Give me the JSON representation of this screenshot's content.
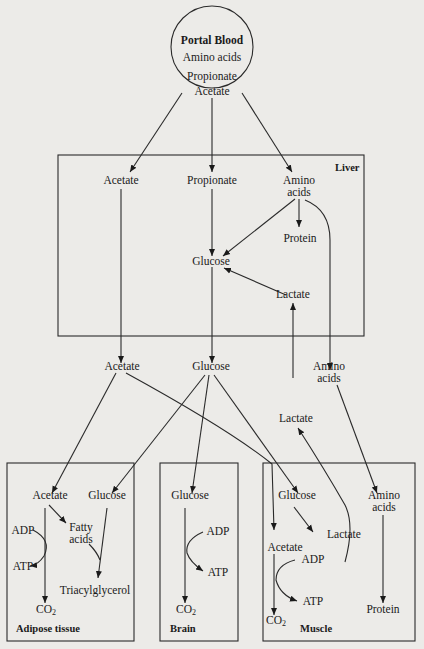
{
  "source": {
    "title": "Portal Blood",
    "items": [
      "Amino acids",
      "Propionate",
      "Acetate"
    ]
  },
  "liver": {
    "title": "Liver",
    "nodes": {
      "acetate": "Acetate",
      "propionate": "Propionate",
      "amino_acids": "Amino acids",
      "protein": "Protein",
      "glucose": "Glucose",
      "lactate": "Lactate"
    }
  },
  "circulation": {
    "acetate": "Acetate",
    "glucose": "Glucose",
    "amino_acids": "Amino acids",
    "lactate": "Lactate"
  },
  "adipose": {
    "title": "Adipose tissue",
    "nodes": {
      "acetate": "Acetate",
      "glucose": "Glucose",
      "fatty_acids": "Fatty acids",
      "adp": "ADP",
      "atp": "ATP",
      "triacylglycerol": "Triacylglycerol",
      "co2": "CO",
      "co2_sub": "2"
    }
  },
  "brain": {
    "title": "Brain",
    "nodes": {
      "glucose": "Glucose",
      "adp": "ADP",
      "atp": "ATP",
      "co2": "CO",
      "co2_sub": "2"
    }
  },
  "muscle": {
    "title": "Muscle",
    "nodes": {
      "glucose": "Glucose",
      "lactate": "Lactate",
      "amino_acids": "Amino acids",
      "acetate": "Acetate",
      "adp": "ADP",
      "atp": "ATP",
      "protein": "Protein",
      "co2": "CO",
      "co2_sub": "2"
    }
  }
}
